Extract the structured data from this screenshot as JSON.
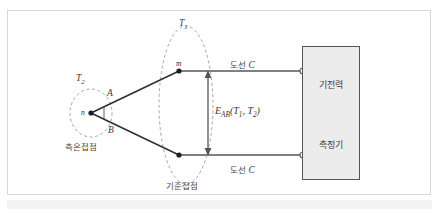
{
  "figure": {
    "type": "thermocouple-circuit-diagram"
  },
  "labels": {
    "hot_junction_temp": "T",
    "hot_junction_temp_sub": "2",
    "cold_junction_temp": "T",
    "cold_junction_temp_sub": "1",
    "conductor_a": "A",
    "conductor_b": "B",
    "junction_point_n": "n",
    "junction_point_m": "m",
    "measuring_junction": "측온접점",
    "reference_junction": "기준접점",
    "lead_wire_upper": "도선",
    "lead_wire_upper_symbol": "C",
    "lead_wire_lower": "도선",
    "lead_wire_lower_symbol": "C",
    "emf_symbol": "E",
    "emf_subscript": "AB",
    "emf_args_open": "(",
    "emf_arg1": "T",
    "emf_arg1_sub": "1",
    "emf_comma": ",",
    "emf_arg2": "T",
    "emf_arg2_sub": "2",
    "emf_args_close": ")"
  },
  "instrument": {
    "line1": "기전력",
    "line2": "측정기"
  },
  "colors": {
    "frame_border": "#d8d8d8",
    "background": "#ffffff",
    "conductor_line": "#2e2e2e",
    "lead_wire": "#808080",
    "dashed_ellipse": "#8a8a8a",
    "box_fill": "#ececec",
    "box_border": "#555555",
    "dimension_line": "#777777",
    "text": "#3a3a3a",
    "bottom_band": "#f3f3f3"
  },
  "geometry": {
    "junction_n": [
      91,
      113
    ],
    "junction_m": [
      179,
      71
    ],
    "junction_lower": [
      179,
      155
    ],
    "terminal_upper": [
      303,
      71
    ],
    "terminal_lower": [
      303,
      155
    ],
    "emf_dimension_x": 208,
    "emf_dimension_top": 72,
    "emf_dimension_bottom": 154
  }
}
